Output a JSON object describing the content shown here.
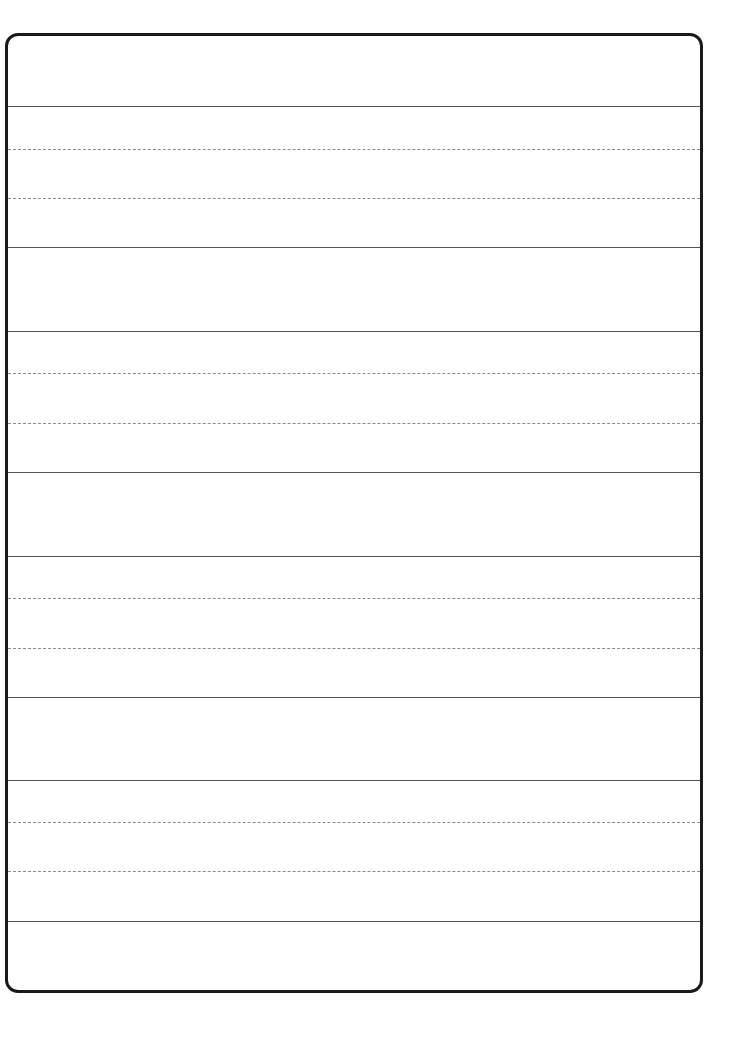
{
  "page": {
    "type": "handwriting-practice-sheet",
    "background_color": "#ffffff",
    "border_color": "#1a1a1a",
    "solid_line_color": "#555555",
    "dashed_line_color": "#8a8a8a"
  },
  "line_groups": [
    {
      "lines": [
        {
          "y": 106,
          "style": "solid"
        },
        {
          "y": 149,
          "style": "dashed"
        },
        {
          "y": 198,
          "style": "dashed"
        },
        {
          "y": 247,
          "style": "solid"
        }
      ]
    },
    {
      "lines": [
        {
          "y": 331,
          "style": "solid"
        },
        {
          "y": 373,
          "style": "dashed"
        },
        {
          "y": 423,
          "style": "dashed"
        },
        {
          "y": 472,
          "style": "solid"
        }
      ]
    },
    {
      "lines": [
        {
          "y": 556,
          "style": "solid"
        },
        {
          "y": 598,
          "style": "dashed"
        },
        {
          "y": 648,
          "style": "dashed"
        },
        {
          "y": 697,
          "style": "solid"
        }
      ]
    },
    {
      "lines": [
        {
          "y": 780,
          "style": "solid"
        },
        {
          "y": 822,
          "style": "dashed"
        },
        {
          "y": 871,
          "style": "dashed"
        },
        {
          "y": 921,
          "style": "solid"
        }
      ]
    }
  ]
}
